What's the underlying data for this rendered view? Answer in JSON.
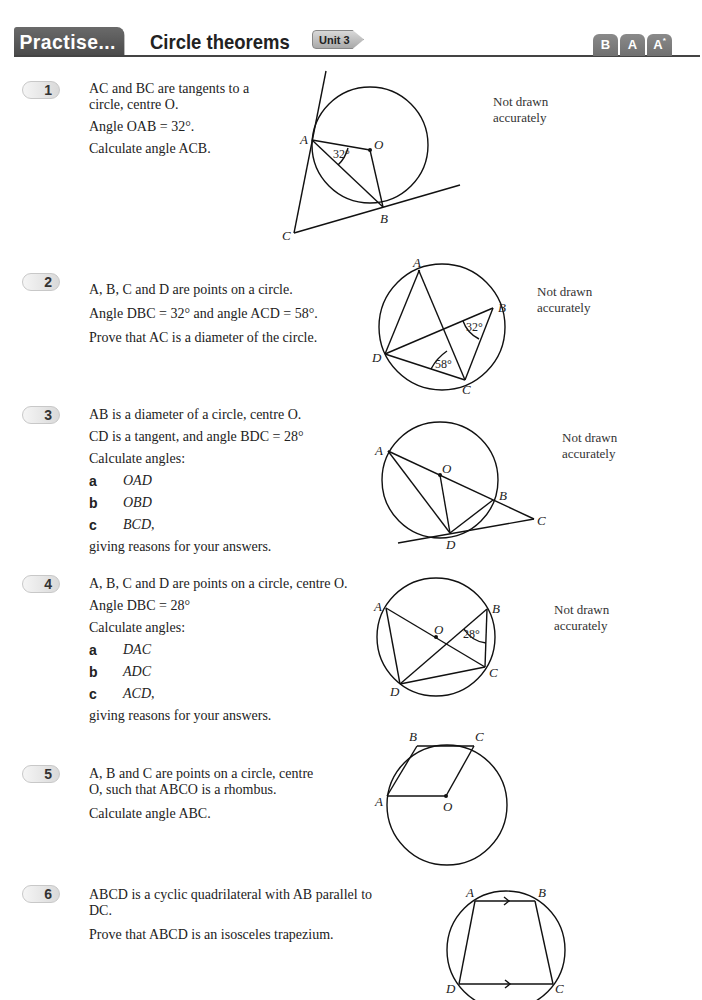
{
  "header": {
    "tab_label": "Practise...",
    "title": "Circle theorems",
    "unit_label": "Unit 3",
    "grades": [
      {
        "label": "B",
        "sup": ""
      },
      {
        "label": "A",
        "sup": ""
      },
      {
        "label": "A",
        "sup": "*"
      }
    ]
  },
  "note": "Not drawn accurately",
  "questions": [
    {
      "number": "1",
      "lines": [
        "AC and BC are tangents to a circle, centre O.",
        "Angle OAB = 32°.",
        "Calculate angle ACB."
      ],
      "figure": {
        "points": [
          "A",
          "B",
          "C",
          "O"
        ],
        "angles": [
          "32°"
        ]
      }
    },
    {
      "number": "2",
      "lines": [
        "A, B, C and D are points on a circle.",
        "Angle DBC = 32° and angle ACD = 58°.",
        "Prove that AC is a diameter of the circle."
      ],
      "figure": {
        "points": [
          "A",
          "B",
          "C",
          "D"
        ],
        "angles": [
          "32°",
          "58°"
        ]
      }
    },
    {
      "number": "3",
      "lines": [
        "AB is a diameter of a circle, centre O.",
        "CD is a tangent, and angle BDC = 28°",
        "Calculate angles:"
      ],
      "parts": [
        {
          "label": "a",
          "value": "OAD"
        },
        {
          "label": "b",
          "value": "OBD"
        },
        {
          "label": "c",
          "value": "BCD,"
        }
      ],
      "closing": "giving reasons for your answers.",
      "figure": {
        "points": [
          "A",
          "B",
          "C",
          "D",
          "O"
        ],
        "angles": []
      }
    },
    {
      "number": "4",
      "lines": [
        "A, B, C and D are points on a circle, centre O.",
        "Angle DBC = 28°",
        "Calculate angles:"
      ],
      "parts": [
        {
          "label": "a",
          "value": "DAC"
        },
        {
          "label": "b",
          "value": "ADC"
        },
        {
          "label": "c",
          "value": "ACD,"
        }
      ],
      "closing": "giving reasons for your answers.",
      "figure": {
        "points": [
          "A",
          "B",
          "C",
          "D",
          "O"
        ],
        "angles": [
          "28°"
        ]
      }
    },
    {
      "number": "5",
      "lines": [
        "A, B and C are points on a circle, centre O, such that ABCO is a rhombus.",
        "Calculate angle ABC."
      ],
      "figure": {
        "points": [
          "A",
          "B",
          "C",
          "O"
        ],
        "angles": []
      }
    },
    {
      "number": "6",
      "lines": [
        "ABCD is a cyclic quadrilateral with AB parallel to DC.",
        "Prove that ABCD is an isosceles trapezium."
      ],
      "figure": {
        "points": [
          "A",
          "B",
          "C",
          "D"
        ],
        "angles": []
      }
    }
  ]
}
